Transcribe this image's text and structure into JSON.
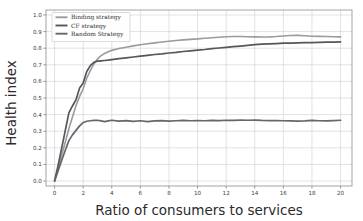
{
  "chart_data": {
    "type": "line",
    "title": "",
    "subtitle": "",
    "xlabel": "Ratio of consumers to services",
    "ylabel": "Health index",
    "xlim": [
      -0.6,
      20.8
    ],
    "ylim": [
      -0.03,
      1.03
    ],
    "xticks": [
      0,
      2,
      4,
      6,
      8,
      10,
      12,
      14,
      16,
      18,
      20
    ],
    "xtick_labels": [
      "0",
      "2",
      "4",
      "6",
      "8",
      "10",
      "12",
      "14",
      "16",
      "18",
      "20"
    ],
    "yticks": [
      0.0,
      0.1,
      0.2,
      0.3,
      0.4,
      0.5,
      0.6,
      0.7,
      0.8,
      0.9,
      1.0
    ],
    "ytick_labels": [
      "0.0",
      "0.1",
      "0.2",
      "0.3",
      "0.4",
      "0.5",
      "0.6",
      "0.7",
      "0.8",
      "0.9",
      "1.0"
    ],
    "grid": true,
    "legend_position": "upper left",
    "x": [
      0,
      0.25,
      0.5,
      0.75,
      1.0,
      1.25,
      1.5,
      1.75,
      2.0,
      2.25,
      2.5,
      2.75,
      3.0,
      3.25,
      3.5,
      3.75,
      4.0,
      4.5,
      5.0,
      5.5,
      6.0,
      6.5,
      7.0,
      7.5,
      8.0,
      8.5,
      9.0,
      9.5,
      10.0,
      10.5,
      11.0,
      11.5,
      12.0,
      12.5,
      13.0,
      13.5,
      14.0,
      14.5,
      15.0,
      15.5,
      16.0,
      16.5,
      17.0,
      17.5,
      18.0,
      18.5,
      19.0,
      19.5,
      20.0
    ],
    "series": [
      {
        "name": "Binding strategy",
        "color": "#9a9a9f",
        "linewidth": 1.6,
        "values": [
          0.0,
          0.075,
          0.155,
          0.235,
          0.315,
          0.385,
          0.455,
          0.51,
          0.555,
          0.62,
          0.665,
          0.705,
          0.735,
          0.755,
          0.768,
          0.778,
          0.787,
          0.798,
          0.806,
          0.814,
          0.821,
          0.827,
          0.832,
          0.837,
          0.842,
          0.846,
          0.85,
          0.853,
          0.856,
          0.86,
          0.863,
          0.866,
          0.869,
          0.87,
          0.87,
          0.869,
          0.868,
          0.867,
          0.868,
          0.87,
          0.873,
          0.876,
          0.877,
          0.875,
          0.872,
          0.871,
          0.87,
          0.869,
          0.868
        ]
      },
      {
        "name": "CF strategy",
        "color": "#56565b",
        "linewidth": 1.7,
        "values": [
          0.0,
          0.095,
          0.2,
          0.305,
          0.41,
          0.452,
          0.49,
          0.56,
          0.59,
          0.66,
          0.695,
          0.715,
          0.722,
          0.724,
          0.726,
          0.728,
          0.731,
          0.737,
          0.742,
          0.747,
          0.752,
          0.757,
          0.762,
          0.766,
          0.771,
          0.775,
          0.78,
          0.784,
          0.788,
          0.792,
          0.797,
          0.801,
          0.805,
          0.809,
          0.813,
          0.817,
          0.821,
          0.824,
          0.826,
          0.828,
          0.83,
          0.831,
          0.832,
          0.833,
          0.834,
          0.835,
          0.836,
          0.837,
          0.838
        ]
      },
      {
        "name": "Random Strategy",
        "color": "#66666b",
        "linewidth": 1.7,
        "values": [
          0.0,
          0.062,
          0.125,
          0.185,
          0.243,
          0.278,
          0.305,
          0.332,
          0.352,
          0.36,
          0.363,
          0.365,
          0.366,
          0.362,
          0.358,
          0.362,
          0.366,
          0.361,
          0.364,
          0.359,
          0.363,
          0.358,
          0.362,
          0.364,
          0.361,
          0.363,
          0.365,
          0.363,
          0.364,
          0.363,
          0.365,
          0.364,
          0.366,
          0.365,
          0.367,
          0.366,
          0.367,
          0.365,
          0.364,
          0.364,
          0.363,
          0.362,
          0.361,
          0.362,
          0.365,
          0.363,
          0.362,
          0.364,
          0.366
        ]
      }
    ],
    "legend_entries": [
      "Binding strategy",
      "CF strategy",
      "Random Strategy"
    ],
    "colors": {
      "background": "#ffffff",
      "grid": "#c9c9cf",
      "frame": "#8d8d93",
      "text": "#2b2b2b"
    }
  }
}
